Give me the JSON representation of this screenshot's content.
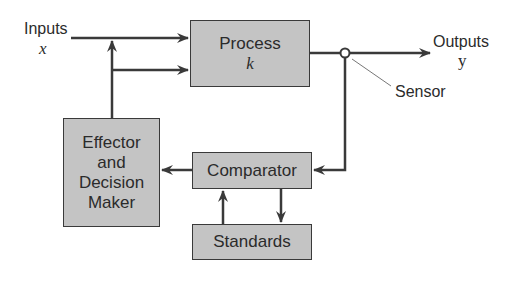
{
  "diagram": {
    "type": "control-loop block diagram",
    "inputs": {
      "label": "Inputs",
      "variable": "x"
    },
    "outputs": {
      "label": "Outputs",
      "variable": "y"
    },
    "sensor": {
      "label": "Sensor"
    },
    "blocks": {
      "process": {
        "label": "Process",
        "variable": "k"
      },
      "effector": {
        "line1": "Effector",
        "line2": "and",
        "line3": "Decision",
        "line4": "Maker"
      },
      "comparator": {
        "label": "Comparator"
      },
      "standards": {
        "label": "Standards"
      }
    },
    "colors": {
      "box_fill": "#c4c4c4",
      "line": "#3a3a3a",
      "text": "#2b2b2b"
    }
  }
}
